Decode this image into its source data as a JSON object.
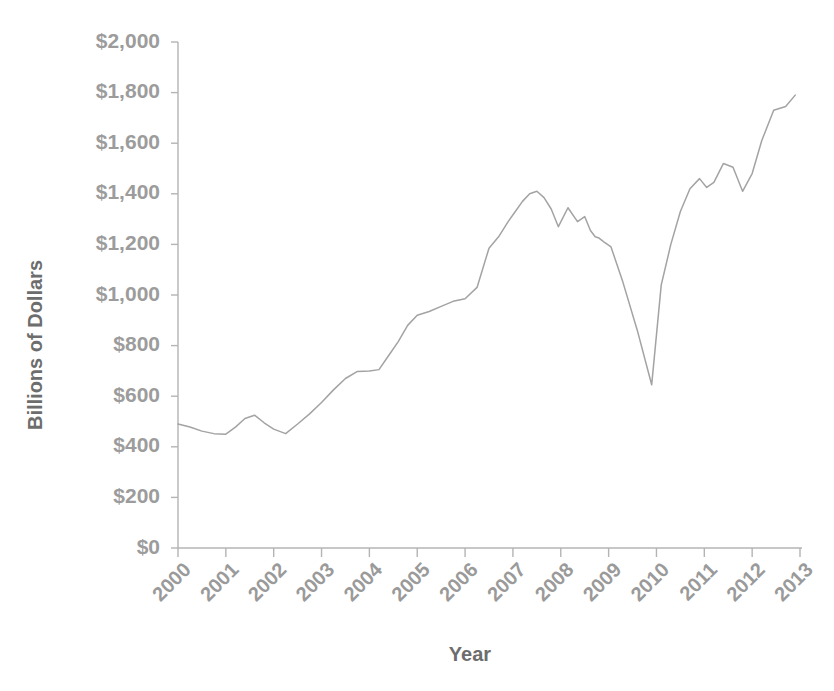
{
  "chart_data": {
    "type": "line",
    "title": "",
    "xlabel": "Year",
    "ylabel": "Billions of Dollars",
    "xlim": [
      2000,
      2013
    ],
    "ylim": [
      0,
      2000
    ],
    "grid": false,
    "legend": "none",
    "line_color": "#a3a3a3",
    "axis_color": "#b4b4b4",
    "label_color": "#9a9a9a",
    "x_tick_labels": [
      "2000",
      "2001",
      "2002",
      "2003",
      "2004",
      "2005",
      "2006",
      "2007",
      "2008",
      "2009",
      "2010",
      "2011",
      "2012",
      "2013"
    ],
    "x_ticks": [
      2000,
      2001,
      2002,
      2003,
      2004,
      2005,
      2006,
      2007,
      2008,
      2009,
      2010,
      2011,
      2012,
      2013
    ],
    "y_tick_labels": [
      "$0",
      "$200",
      "$400",
      "$600",
      "$800",
      "$1,000",
      "$1,200",
      "$1,400",
      "$1,600",
      "$1,800",
      "$2,000"
    ],
    "y_ticks": [
      0,
      200,
      400,
      600,
      800,
      1000,
      1200,
      1400,
      1600,
      1800,
      2000
    ],
    "series": [
      {
        "name": "Billions of Dollars",
        "x": [
          2000.0,
          2000.25,
          2000.5,
          2000.75,
          2001.0,
          2001.2,
          2001.4,
          2001.6,
          2001.8,
          2002.0,
          2002.25,
          2002.5,
          2002.75,
          2003.0,
          2003.25,
          2003.5,
          2003.75,
          2004.0,
          2004.2,
          2004.4,
          2004.6,
          2004.8,
          2005.0,
          2005.25,
          2005.5,
          2005.75,
          2006.0,
          2006.25,
          2006.5,
          2006.7,
          2006.9,
          2007.05,
          2007.2,
          2007.35,
          2007.5,
          2007.65,
          2007.8,
          2007.95,
          2008.15,
          2008.35,
          2008.5,
          2008.62,
          2008.72,
          2008.8,
          2008.9,
          2009.05,
          2009.3,
          2009.6,
          2009.9,
          2010.1,
          2010.3,
          2010.5,
          2010.7,
          2010.9,
          2011.05,
          2011.2,
          2011.4,
          2011.6,
          2011.8,
          2012.0,
          2012.2,
          2012.45,
          2012.7,
          2012.9
        ],
        "values": [
          490,
          478,
          462,
          452,
          450,
          478,
          512,
          525,
          495,
          470,
          452,
          490,
          530,
          575,
          625,
          670,
          698,
          700,
          705,
          760,
          815,
          880,
          920,
          935,
          955,
          975,
          985,
          1030,
          1185,
          1230,
          1290,
          1330,
          1370,
          1400,
          1410,
          1385,
          1340,
          1270,
          1345,
          1290,
          1310,
          1255,
          1230,
          1225,
          1210,
          1190,
          1050,
          860,
          645,
          1040,
          1200,
          1330,
          1420,
          1460,
          1425,
          1445,
          1520,
          1505,
          1410,
          1480,
          1610,
          1730,
          1745,
          1790
        ]
      }
    ],
    "annotations": [
      {
        "label": "start-2000",
        "value": 490
      },
      {
        "label": "peak-2006",
        "value": 1410
      },
      {
        "label": "trough-2009-crash",
        "value": 645
      },
      {
        "label": "end-2013",
        "value": 1790
      }
    ]
  },
  "axes": {
    "y_axis_title": "Billions of Dollars",
    "x_axis_title": "Year"
  }
}
